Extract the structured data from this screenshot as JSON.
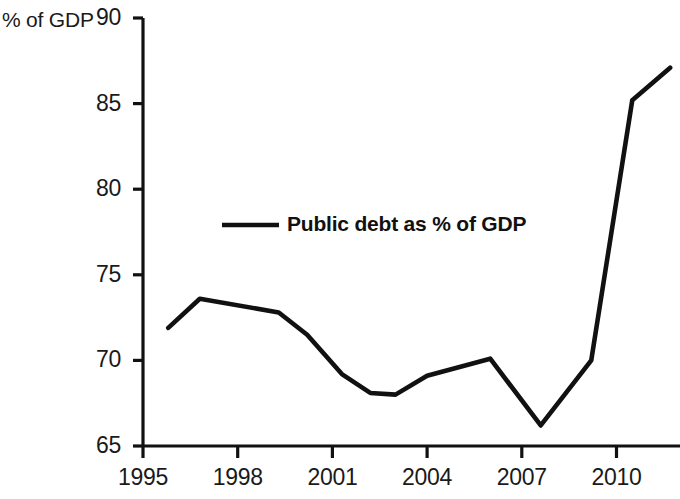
{
  "chart_data": {
    "type": "line",
    "title": "",
    "xlabel": "",
    "ylabel": "% of GDP",
    "xlim": [
      1995,
      2011.8
    ],
    "ylim": [
      65,
      90
    ],
    "grid": false,
    "legend_position": "inside-upper-left",
    "x_ticks": [
      "1995",
      "1998",
      "2001",
      "2004",
      "2007",
      "2010"
    ],
    "x_tick_values": [
      1995,
      1998,
      2001,
      2004,
      2007,
      2010
    ],
    "y_ticks": [
      "65",
      "70",
      "75",
      "80",
      "85",
      "90"
    ],
    "y_tick_values": [
      65,
      70,
      75,
      80,
      85,
      90
    ],
    "series": [
      {
        "name": "Public debt as % of GDP",
        "color": "#111111",
        "x": [
          1995.8,
          1996.8,
          1999.3,
          2000.2,
          2001.3,
          2002.2,
          2003.0,
          2004.0,
          2006.0,
          2007.6,
          2009.2,
          2010.5,
          2011.7
        ],
        "values": [
          71.9,
          73.6,
          72.8,
          71.5,
          69.2,
          68.1,
          68.0,
          69.1,
          70.1,
          66.2,
          70.0,
          85.2,
          87.1
        ]
      }
    ]
  },
  "axis": {
    "unit_label": "% of GDP"
  },
  "legend": {
    "entries": [
      {
        "label": "Public debt as % of GDP"
      }
    ]
  }
}
